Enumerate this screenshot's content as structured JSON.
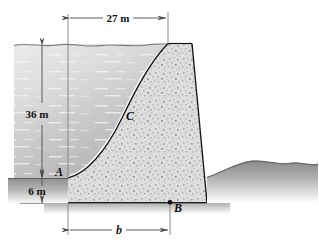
{
  "figure": {
    "dimensions": {
      "top_width": "27 m",
      "water_depth": "36 m",
      "base_offset": "6 m",
      "base_width": "b"
    },
    "labels": {
      "point_a": "A",
      "point_b": "B",
      "point_c": "C"
    },
    "colors": {
      "water_light": "#e6e6e6",
      "water_dark": "#b9b9b9",
      "concrete": "#d8d8d8",
      "ground": "#9a9a9a",
      "outline": "#1c1c1c",
      "dimension": "#555555"
    }
  }
}
